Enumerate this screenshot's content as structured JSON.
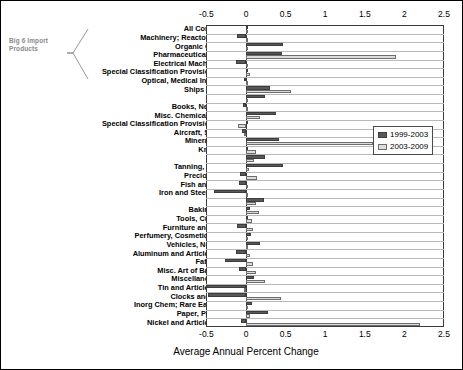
{
  "annotation": {
    "text": "Big 6 Import Products"
  },
  "legend": {
    "items": [
      {
        "label": "1999-2003",
        "color": "#585858",
        "key": "s1"
      },
      {
        "label": "2003-2009",
        "color": "#dcdcdc",
        "key": "s2"
      }
    ]
  },
  "chart_data": {
    "type": "bar",
    "orientation": "horizontal",
    "title": "",
    "xlabel": "Average Annual Percent Change",
    "ylabel": "",
    "xlim": [
      -0.5,
      2.5
    ],
    "xticks": [
      -0.5,
      0,
      0.5,
      1,
      1.5,
      2,
      2.5
    ],
    "xtick_labels": [
      "-0.5",
      "0",
      "0.5",
      "1",
      "1.5",
      "2",
      "2.5"
    ],
    "ticks_top": true,
    "ticks_bottom": true,
    "grid": "horizontal",
    "legend_position": "center-right",
    "categories": [
      "All Commodities",
      "Machinery; Reactors, Boilers",
      "Organic Chemicals",
      "Pharmaceutical Products",
      "Electrical Machinery, Etc.",
      "Special Classification Provisions, Nesoi",
      "Optical, Medical Instruments",
      "Ships and Boats",
      "Plastic",
      "Books, Newspapers",
      "Misc. Chemical Products",
      "Special Classification Provisions, Nesoi",
      "Aircraft, Spacecraft",
      "Mineral Fuel, Oil",
      "Knit Apparel",
      "Cocoa",
      "Tanning, Dye, Paint",
      "Precious Stones",
      "Fish and Seafood",
      "Iron and Steel Products",
      "Rubber",
      "Baking Related",
      "Tools, Cutlery, Etc.",
      "Furniture and Bedding",
      "Perfumery, Cosmetic Products",
      "Vehicles, Not Railway",
      "Aluminum and Articles Thereof",
      "Fats and Oils",
      "Misc. Art of Base Metals",
      "Miscellaneous Food",
      "Tin and Articles Thereof",
      "Clocks and Watches",
      "Inorg Chem; Rare Earth Metals",
      "Paper, Paperboard",
      "Nickel and Articles Thereof"
    ],
    "series": [
      {
        "name": "1999-2003",
        "color": "#585858",
        "values": [
          0.03,
          -0.12,
          0.47,
          0.46,
          -0.13,
          0.02,
          -0.03,
          0.3,
          0.24,
          -0.04,
          0.38,
          0.02,
          -0.05,
          0.42,
          0.03,
          0.24,
          0.47,
          -0.08,
          -0.09,
          -0.4,
          0.23,
          0.05,
          0.03,
          -0.11,
          0.06,
          0.18,
          -0.13,
          -0.27,
          -0.09,
          0.1,
          -0.5,
          -0.48,
          0.07,
          0.28,
          -0.06
        ]
      },
      {
        "name": "2003-2009",
        "color": "#dcdcdc",
        "values": [
          0.01,
          0.02,
          0.02,
          1.9,
          0.0,
          0.05,
          0.01,
          0.57,
          0.02,
          0.0,
          0.18,
          -0.1,
          -0.03,
          1.6,
          0.12,
          0.1,
          0.04,
          0.14,
          0.02,
          0.03,
          0.12,
          0.16,
          0.08,
          0.09,
          0.03,
          0.02,
          0.05,
          0.09,
          0.12,
          0.24,
          -0.02,
          0.44,
          0.02,
          0.05,
          2.2
        ]
      }
    ]
  }
}
